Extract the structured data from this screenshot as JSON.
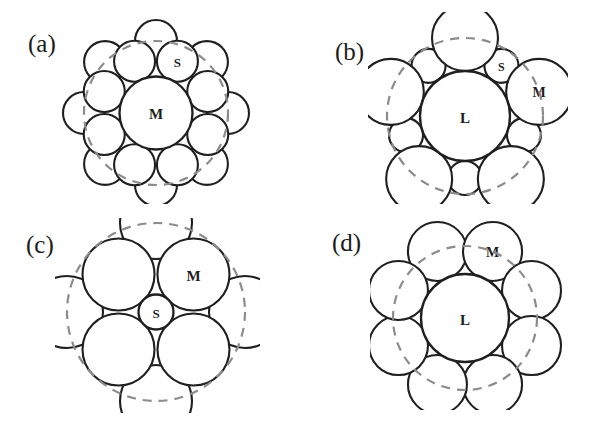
{
  "figure": {
    "background": "#ffffff",
    "stroke_color": "#1f1f1f",
    "dashed_color": "#8c8c8c",
    "fill_color": "#ffffff",
    "label_color": "#1c1c1c"
  },
  "panels": [
    {
      "id": "a",
      "label": "(a)",
      "label_x": 28,
      "label_y": 30,
      "origin_x": 60,
      "origin_y": 14,
      "width": 195,
      "height": 190,
      "center_x": 96,
      "center_y": 99,
      "description": "Medium central sphere with two rings of small spheres",
      "core": {
        "label": "M",
        "cx": 96,
        "cy": 99,
        "r": 36.5,
        "label_dx": 0,
        "label_dy": 1,
        "font_size": 15
      },
      "rings": [
        {
          "name": "inner-ring",
          "count": 8,
          "radius": 56,
          "circle_r": 20.5,
          "start_angle": -112.5,
          "labeled_index": 1,
          "label": "S",
          "label_font_size": 13
        },
        {
          "name": "outer-ring",
          "count": 8,
          "radius": 72,
          "circle_r": 21,
          "start_angle": -90,
          "labeled_index": -1,
          "label": "",
          "label_font_size": 13
        }
      ],
      "dashed_circles": [
        {
          "cx": 96,
          "cy": 99,
          "r": 72
        }
      ]
    },
    {
      "id": "b",
      "label": "(b)",
      "label_x": 335,
      "label_y": 38,
      "origin_x": 368,
      "origin_y": 12,
      "width": 200,
      "height": 192,
      "center_x": 97,
      "center_y": 104,
      "description": "Large central sphere with five medium and five small spheres alternating",
      "core": {
        "label": "L",
        "cx": 97,
        "cy": 104,
        "r": 45,
        "label_dx": 0,
        "label_dy": 2,
        "font_size": 15
      },
      "rings": [
        {
          "name": "medium-ring",
          "count": 5,
          "radius": 78,
          "circle_r": 33,
          "start_angle": -90,
          "labeled_index": 1,
          "label": "M",
          "label_font_size": 14
        },
        {
          "name": "small-ring",
          "count": 5,
          "radius": 62,
          "circle_r": 17,
          "start_angle": -54,
          "labeled_index": 0,
          "label": "S",
          "label_font_size": 12
        }
      ],
      "dashed_circles": [
        {
          "cx": 97,
          "cy": 104,
          "r": 78
        }
      ]
    },
    {
      "id": "c",
      "label": "(c)",
      "label_x": 26,
      "label_y": 231,
      "origin_x": 55,
      "origin_y": 218,
      "width": 205,
      "height": 195,
      "center_x": 101,
      "center_y": 94,
      "description": "Small central sphere with four medium spheres and four outer spheres",
      "core": {
        "label": "S",
        "cx": 101,
        "cy": 94,
        "r": 17.5,
        "label_dx": 0,
        "label_dy": 1,
        "font_size": 13
      },
      "rings": [
        {
          "name": "medium-ring",
          "count": 4,
          "radius": 53,
          "circle_r": 36,
          "start_angle": -45,
          "labeled_index": 0,
          "label": "M",
          "label_font_size": 15
        },
        {
          "name": "outer-ring",
          "count": 4,
          "radius": 89,
          "circle_r": 36,
          "start_angle": -90,
          "labeled_index": -1,
          "label": "",
          "label_font_size": 13
        }
      ],
      "dashed_circles": [
        {
          "cx": 101,
          "cy": 94,
          "r": 89
        }
      ]
    },
    {
      "id": "d",
      "label": "(d)",
      "label_x": 332,
      "label_y": 229,
      "origin_x": 370,
      "origin_y": 220,
      "width": 195,
      "height": 190,
      "center_x": 95,
      "center_y": 98,
      "description": "Large central sphere with eight medium spheres around it",
      "core": {
        "label": "L",
        "cx": 95,
        "cy": 98,
        "r": 44,
        "label_dx": 0,
        "label_dy": 2,
        "font_size": 15
      },
      "rings": [
        {
          "name": "medium-ring",
          "count": 8,
          "radius": 72,
          "circle_r": 29.5,
          "start_angle": -112.5,
          "labeled_index": 1,
          "label": "M",
          "label_font_size": 14
        }
      ],
      "dashed_circles": [
        {
          "cx": 95,
          "cy": 98,
          "r": 72
        }
      ]
    }
  ]
}
